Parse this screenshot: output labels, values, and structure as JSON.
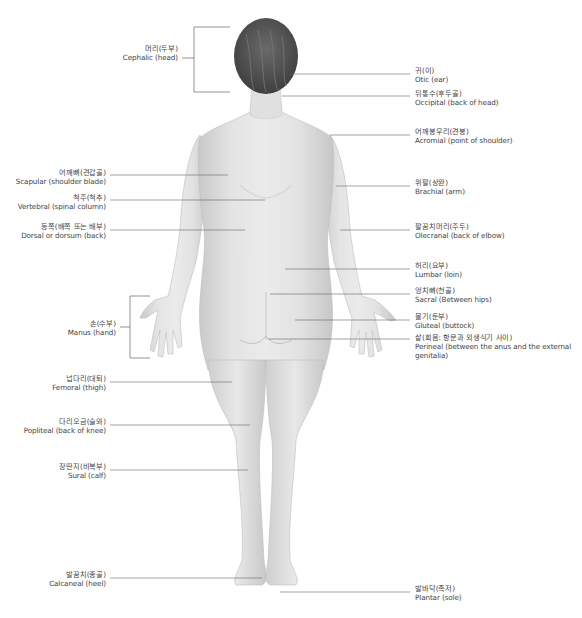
{
  "figure": {
    "colors": {
      "skin": "#e2e2e2",
      "skin_shadow": "#c4c4c4",
      "hair": "#555555",
      "leader_line": "#666666",
      "text": "#444444"
    }
  },
  "labels": {
    "left": [
      {
        "ko": "머리(두부)",
        "en": "Cephalic (head)"
      },
      {
        "ko": "어깨뼈(견갑골)",
        "en": "Scapular (shoulder blade)"
      },
      {
        "ko": "척주(척추)",
        "en": "Vertebral (spinal column)"
      },
      {
        "ko": "등쪽(배쪽 또는 배부)",
        "en": "Dorsal or dorsum (back)"
      },
      {
        "ko": "손(수부)",
        "en": "Manus (hand)"
      },
      {
        "ko": "넙다리(대퇴)",
        "en": "Femoral (thigh)"
      },
      {
        "ko": "다리오금(슬와)",
        "en": "Popliteal (back of knee)"
      },
      {
        "ko": "장딴지(비복부)",
        "en": "Sural (calf)"
      },
      {
        "ko": "발꿈치(종골)",
        "en": "Calcaneal (heel)"
      }
    ],
    "right": [
      {
        "ko": "귀(이)",
        "en": "Otic (ear)"
      },
      {
        "ko": "뒤통수(후두골)",
        "en": "Occipital (back of head)"
      },
      {
        "ko": "어깨봉우리(견봉)",
        "en": "Acromial (point of shoulder)"
      },
      {
        "ko": "위팔(상완)",
        "en": "Brachial (arm)"
      },
      {
        "ko": "팔꿈치머리(주두)",
        "en": "Olecranal (back of elbow)"
      },
      {
        "ko": "허리(요부)",
        "en": "Lumbar (loin)"
      },
      {
        "ko": "엉치뼈(천골)",
        "en": "Sacral (Between hips)"
      },
      {
        "ko": "볼기(둔부)",
        "en": "Gluteal (buttock)"
      },
      {
        "ko": "샅(회음: 항문과 외생식기 사이)",
        "en": "Perineal (between the anus and the external genitalia)"
      },
      {
        "ko": "발바닥(족저)",
        "en": "Plantar (sole)"
      }
    ]
  }
}
